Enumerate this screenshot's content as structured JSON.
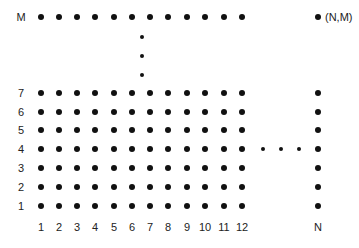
{
  "diagram": {
    "title": "",
    "column_labels": [
      "1",
      "2",
      "3",
      "4",
      "5",
      "6",
      "7",
      "8",
      "9",
      "10",
      "11",
      "12"
    ],
    "last_column_label": "N",
    "row_labels": [
      "1",
      "2",
      "3",
      "4",
      "5",
      "6",
      "7"
    ],
    "top_row_label": "M",
    "corner_label": "(N,M)",
    "column_x": [
      41,
      59,
      77,
      95,
      114,
      132,
      150,
      168,
      187,
      205,
      224,
      242
    ],
    "last_column_x": 318,
    "row_y": [
      206,
      187,
      168,
      149,
      130,
      112,
      93
    ],
    "top_row_y": 17,
    "row_label_x": 21,
    "column_label_y": 227,
    "vertical_ellipsis": {
      "x": 142,
      "y": [
        37,
        56,
        75
      ]
    },
    "horizontal_ellipsis": {
      "y": 149,
      "x": [
        263,
        281,
        299
      ]
    },
    "dot_color": "#111111"
  }
}
